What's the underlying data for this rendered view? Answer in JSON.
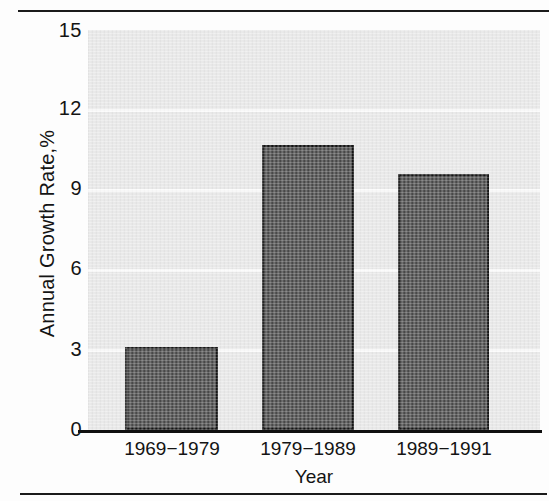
{
  "figure": {
    "rule_top": "horizontal-rule",
    "rule_bottom": "horizontal-rule"
  },
  "chart_data": {
    "type": "bar",
    "title": "",
    "xlabel": "Year",
    "ylabel": "Annual Growth Rate,%",
    "categories": [
      "1969−1979",
      "1979−1989",
      "1989−1991"
    ],
    "values": [
      3.1,
      10.7,
      9.6
    ],
    "ylim": [
      0,
      15
    ],
    "yticks": [
      0,
      3,
      6,
      9,
      12,
      15
    ],
    "ytick_labels": [
      "0",
      "3",
      "6",
      "9",
      "12",
      "15"
    ],
    "xlim_categories": 3,
    "grid": true,
    "gridlines_at": [
      3,
      6,
      9,
      12
    ],
    "legend": null,
    "legend_position": "none",
    "bar_color": "#4a4a4a",
    "bar_edge_color": "#151515",
    "plot_background": "#e9e9e9",
    "gridline_color": "#fbfbfb",
    "axis_color": "#101010"
  }
}
